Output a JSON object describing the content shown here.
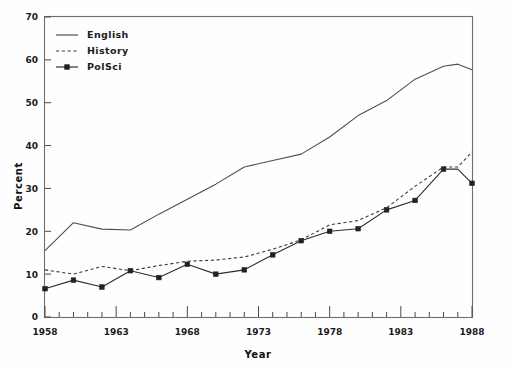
{
  "chart_data": {
    "type": "line",
    "title": "",
    "subtitle": "",
    "xlabel": "Year",
    "ylabel": "Percent",
    "xlim": [
      1958,
      1988
    ],
    "ylim": [
      0,
      70
    ],
    "grid": false,
    "legend_position": "top-left",
    "x_tick_labels": [
      "1958",
      "1963",
      "1968",
      "1973",
      "1978",
      "1983",
      "1988"
    ],
    "x_major_ticks": [
      1958,
      1963,
      1968,
      1973,
      1978,
      1983,
      1988
    ],
    "x_minor_tick_interval": 1,
    "y_tick_labels": [
      "0",
      "10",
      "20",
      "30",
      "40",
      "50",
      "60",
      "70"
    ],
    "y_ticks": [
      0,
      10,
      20,
      30,
      40,
      50,
      60,
      70
    ],
    "x": [
      1958,
      1960,
      1962,
      1964,
      1966,
      1968,
      1970,
      1972,
      1974,
      1976,
      1978,
      1980,
      1982,
      1984,
      1986,
      1987,
      1988
    ],
    "series": [
      {
        "name": "English",
        "style": "solid",
        "markers": false,
        "color": "#4e4e4e",
        "values": [
          15.5,
          22.0,
          20.5,
          20.3,
          24.0,
          27.5,
          31.0,
          35.0,
          36.5,
          38.0,
          42.0,
          47.0,
          50.5,
          55.5,
          58.5,
          59.0,
          57.7
        ]
      },
      {
        "name": "History",
        "style": "dashed",
        "markers": false,
        "color": "#3a3a3a",
        "values": [
          11.0,
          10.0,
          11.8,
          10.8,
          12.0,
          13.0,
          13.3,
          14.0,
          15.8,
          18.0,
          21.5,
          22.5,
          25.5,
          30.5,
          35.0,
          35.0,
          38.5
        ]
      },
      {
        "name": "PolSci",
        "style": "solid-marker",
        "markers": true,
        "color": "#2e2e2e",
        "values": [
          6.6,
          8.6,
          7.0,
          10.8,
          9.2,
          12.3,
          10.0,
          11.0,
          14.5,
          17.8,
          20.0,
          20.6,
          25.0,
          27.2,
          34.5,
          34.5,
          31.2
        ]
      }
    ]
  },
  "legend": {
    "items": [
      {
        "label": "English",
        "style": "solid"
      },
      {
        "label": "History",
        "style": "dashed"
      },
      {
        "label": "PolSci",
        "style": "solid-marker"
      }
    ]
  },
  "axes": {
    "y_title": "Percent",
    "x_title": "Year"
  }
}
